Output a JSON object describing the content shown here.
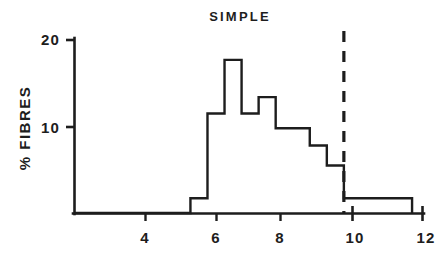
{
  "figure": {
    "background_color": "#ffffff",
    "ink_color": "#1d1d1d"
  },
  "chart_data": {
    "type": "bar",
    "title": "SIMPLE",
    "xlabel": "",
    "ylabel": "% FIBRES",
    "style": "step-histogram",
    "grid": false,
    "legend": "none",
    "xlim": [
      2.1,
      12.35
    ],
    "ylim": [
      0,
      20.5
    ],
    "x_ticks": [
      4,
      6,
      8,
      10,
      12
    ],
    "x_tick_labels": [
      "4",
      "6",
      "8",
      "10",
      "12"
    ],
    "y_ticks": [
      10,
      20
    ],
    "y_tick_labels": [
      "10",
      "20"
    ],
    "bin_width": 0.5,
    "bin_edges": [
      5.5,
      6.0,
      6.5,
      7.0,
      7.5,
      8.0,
      8.5,
      9.0,
      9.5,
      10.0,
      12.0
    ],
    "values": [
      1.7,
      11.5,
      17.7,
      11.5,
      13.4,
      9.8,
      9.8,
      7.8,
      5.5,
      1.7
    ],
    "bins": [
      {
        "range": "5.5-6.0",
        "value": 1.7
      },
      {
        "range": "6.0-6.5",
        "value": 11.5
      },
      {
        "range": "6.5-7.0",
        "value": 17.7
      },
      {
        "range": "7.0-7.5",
        "value": 11.5
      },
      {
        "range": "7.5-8.0",
        "value": 13.4
      },
      {
        "range": "8.0-8.5",
        "value": 9.8
      },
      {
        "range": "8.5-9.0",
        "value": 9.8
      },
      {
        "range": "9.0-9.5",
        "value": 7.8
      },
      {
        "range": "9.5-10.0",
        "value": 5.5
      },
      {
        "range": "10.0-12.0",
        "value": 1.7
      }
    ],
    "annotations": [
      {
        "type": "vertical-dashed-line",
        "x": 10,
        "label": ""
      }
    ]
  }
}
